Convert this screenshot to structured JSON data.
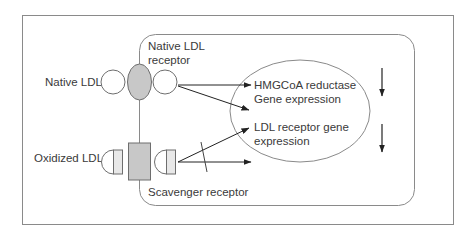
{
  "diagram": {
    "labels": {
      "native_ldl": "Native LDL",
      "native_ldl_receptor_line1": "Native LDL",
      "native_ldl_receptor_line2": "receptor",
      "oxidized_ldl": "Oxidized LDL",
      "scavenger_receptor": "Scavenger receptor",
      "hmgcoa_line1": "HMGCoA reductase",
      "hmgcoa_line2": "Gene expression",
      "ldlr_line1": "LDL receptor gene",
      "ldlr_line2": "expression"
    },
    "colors": {
      "stroke": "#6e6e6e",
      "receptor_fill": "#c8c8c8",
      "ligand_fill": "#ffffff",
      "ligand_stripe_fill": "#e8e8e8",
      "arrow": "#222222",
      "text": "#3a3a3a"
    },
    "effects": [
      {
        "target": "HMGCoA reductase Gene expression",
        "direction": "down"
      },
      {
        "target": "LDL receptor gene expression",
        "direction": "down"
      }
    ]
  }
}
